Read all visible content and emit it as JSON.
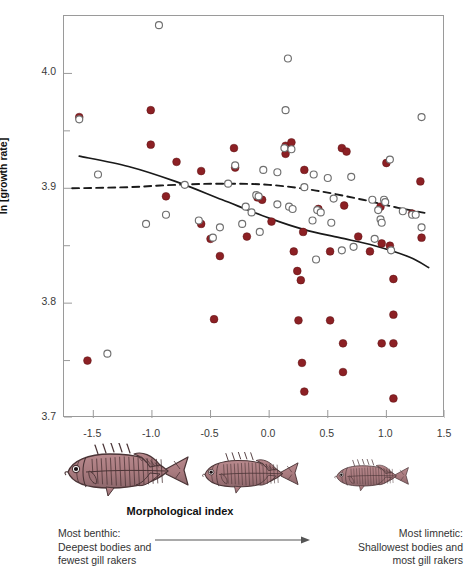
{
  "chart_data": {
    "type": "scatter",
    "title": "",
    "xlabel": "Morphological index",
    "ylabel": "ln [growth rate]",
    "xlim": [
      -1.75,
      1.5
    ],
    "ylim": [
      3.7,
      4.05
    ],
    "xticks": [
      "-1.5",
      "-1.0",
      "-0.5",
      "0.0",
      "0.5",
      "1.0",
      "1.5"
    ],
    "xtick_values": [
      -1.5,
      -1.0,
      -0.5,
      0.0,
      0.5,
      1.0,
      1.5
    ],
    "yticks": [
      "4.0",
      "3.9",
      "3.8",
      "3.7"
    ],
    "ytick_values": [
      4.0,
      3.9,
      3.8,
      3.7
    ],
    "yminor_values": [
      4.05,
      3.95,
      3.85,
      3.75
    ],
    "grid": false,
    "legend": "none",
    "series": [
      {
        "name": "filled",
        "marker": "filled-circle",
        "color": "#8C2024",
        "points": [
          [
            -1.62,
            3.962
          ],
          [
            -1.01,
            3.968
          ],
          [
            -1.01,
            3.938
          ],
          [
            -0.79,
            3.923
          ],
          [
            -0.58,
            3.915
          ],
          [
            -0.3,
            3.935
          ],
          [
            -0.29,
            3.918
          ],
          [
            -0.1,
            3.892
          ],
          [
            -0.06,
            3.89
          ],
          [
            0.14,
            3.937
          ],
          [
            0.14,
            3.93
          ],
          [
            0.19,
            3.94
          ],
          [
            0.3,
            3.916
          ],
          [
            0.62,
            3.935
          ],
          [
            0.66,
            3.932
          ],
          [
            1.0,
            3.922
          ],
          [
            1.29,
            3.906
          ],
          [
            -0.88,
            3.893
          ],
          [
            0.64,
            3.885
          ],
          [
            0.95,
            3.884
          ],
          [
            1.22,
            3.878
          ],
          [
            -0.58,
            3.869
          ],
          [
            0.02,
            3.871
          ],
          [
            0.42,
            3.882
          ],
          [
            1.3,
            3.857
          ],
          [
            -0.5,
            3.856
          ],
          [
            -0.19,
            3.858
          ],
          [
            0.76,
            3.858
          ],
          [
            0.29,
            3.862
          ],
          [
            0.96,
            3.852
          ],
          [
            1.03,
            3.85
          ],
          [
            0.21,
            3.845
          ],
          [
            0.52,
            3.845
          ],
          [
            -0.42,
            3.841
          ],
          [
            0.24,
            3.828
          ],
          [
            0.27,
            3.82
          ],
          [
            1.06,
            3.821
          ],
          [
            0.86,
            3.845
          ],
          [
            -0.47,
            3.786
          ],
          [
            0.25,
            3.785
          ],
          [
            0.52,
            3.785
          ],
          [
            1.06,
            3.79
          ],
          [
            0.63,
            3.765
          ],
          [
            0.96,
            3.765
          ],
          [
            1.06,
            3.765
          ],
          [
            -1.55,
            3.75
          ],
          [
            0.28,
            3.748
          ],
          [
            0.63,
            3.74
          ],
          [
            0.3,
            3.723
          ],
          [
            1.06,
            3.717
          ]
        ]
      },
      {
        "name": "open",
        "marker": "open-circle",
        "color": "#6f6f6f",
        "points": [
          [
            -0.94,
            4.042
          ],
          [
            0.16,
            4.013
          ],
          [
            0.14,
            3.968
          ],
          [
            -1.62,
            3.96
          ],
          [
            1.3,
            3.962
          ],
          [
            0.13,
            3.935
          ],
          [
            0.19,
            3.934
          ],
          [
            1.03,
            3.925
          ],
          [
            -1.46,
            3.912
          ],
          [
            -0.29,
            3.92
          ],
          [
            -0.05,
            3.916
          ],
          [
            0.07,
            3.914
          ],
          [
            0.38,
            3.912
          ],
          [
            0.5,
            3.909
          ],
          [
            0.7,
            3.91
          ],
          [
            -0.72,
            3.903
          ],
          [
            -0.35,
            3.904
          ],
          [
            0.3,
            3.901
          ],
          [
            -0.11,
            3.894
          ],
          [
            -0.09,
            3.893
          ],
          [
            0.55,
            3.891
          ],
          [
            0.88,
            3.89
          ],
          [
            0.98,
            3.89
          ],
          [
            0.99,
            3.888
          ],
          [
            -0.2,
            3.884
          ],
          [
            0.07,
            3.886
          ],
          [
            0.17,
            3.884
          ],
          [
            0.2,
            3.882
          ],
          [
            0.93,
            3.881
          ],
          [
            1.14,
            3.88
          ],
          [
            1.22,
            3.877
          ],
          [
            1.25,
            3.877
          ],
          [
            -0.88,
            3.877
          ],
          [
            -0.15,
            3.879
          ],
          [
            0.41,
            3.881
          ],
          [
            0.44,
            3.879
          ],
          [
            -1.05,
            3.869
          ],
          [
            -0.6,
            3.872
          ],
          [
            -0.23,
            3.869
          ],
          [
            0.37,
            3.872
          ],
          [
            0.53,
            3.87
          ],
          [
            0.95,
            3.873
          ],
          [
            0.96,
            3.87
          ],
          [
            1.3,
            3.866
          ],
          [
            -0.42,
            3.866
          ],
          [
            -0.08,
            3.862
          ],
          [
            -0.48,
            3.857
          ],
          [
            0.9,
            3.856
          ],
          [
            0.62,
            3.846
          ],
          [
            0.72,
            3.849
          ],
          [
            1.04,
            3.846
          ],
          [
            -1.38,
            3.756
          ],
          [
            0.4,
            3.838
          ]
        ]
      }
    ],
    "trend_lines": [
      {
        "name": "solid-trend",
        "style": "solid",
        "color": "#1a1a1a",
        "points": [
          [
            -1.62,
            3.928
          ],
          [
            -1.2,
            3.919
          ],
          [
            -0.8,
            3.906
          ],
          [
            -0.4,
            3.89
          ],
          [
            0.0,
            3.874
          ],
          [
            0.3,
            3.864
          ],
          [
            0.6,
            3.857
          ],
          [
            0.9,
            3.85
          ],
          [
            1.2,
            3.84
          ],
          [
            1.36,
            3.831
          ]
        ]
      },
      {
        "name": "dashed-trend",
        "style": "dashed",
        "color": "#1a1a1a",
        "points": [
          [
            -1.68,
            3.9
          ],
          [
            -1.2,
            3.901
          ],
          [
            -0.8,
            3.903
          ],
          [
            -0.4,
            3.904
          ],
          [
            0.0,
            3.903
          ],
          [
            0.4,
            3.898
          ],
          [
            0.8,
            3.89
          ],
          [
            1.1,
            3.883
          ],
          [
            1.36,
            3.878
          ]
        ]
      }
    ]
  },
  "axis": {
    "y_title": "ln [growth rate]",
    "x_title": "Morphological index",
    "y_tick_labels": [
      "4.0",
      "3.9",
      "3.8",
      "3.7"
    ],
    "x_tick_labels": [
      "-1.5",
      "-1.0",
      "-0.5",
      "0.0",
      "0.5",
      "1.0",
      "1.5"
    ]
  },
  "fish": [
    {
      "name": "benthic-stickleback",
      "scale": 1.0,
      "label": "most benthic"
    },
    {
      "name": "intermediate-stickleback",
      "scale": 0.78,
      "label": "intermediate"
    },
    {
      "name": "limnetic-stickleback",
      "scale": 0.6,
      "label": "most limnetic"
    }
  ],
  "annotations": {
    "left": "Most benthic:\nDeepest bodies and\nfewest gill rakers",
    "right": "Most limnetic:\nShallowest bodies and\nmost gill rakers"
  },
  "colors": {
    "filled_marker": "#8C2024",
    "open_marker": "#6f6f6f",
    "trend_line": "#1a1a1a",
    "frame": "#9a9a9a",
    "fish_body": "#a87a7e",
    "fish_outline": "#4a3436",
    "text": "#333333"
  }
}
